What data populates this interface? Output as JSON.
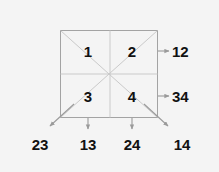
{
  "diagram": {
    "type": "2x2-grid-with-pair-arrows",
    "background_color": "#f4f4f4",
    "grid_line_color": "#c9c9c9",
    "border_color": "#a0a0a0",
    "diagonal_color": "#c9c9c9",
    "arrow_color": "#9a9a9a",
    "text_color": "#111111",
    "square": {
      "x": 60,
      "y": 30,
      "width": 98,
      "height": 88,
      "rows": 2,
      "cols": 2
    },
    "cells": [
      {
        "label": "1",
        "row": 0,
        "col": 0,
        "cx": 88,
        "cy": 51
      },
      {
        "label": "2",
        "row": 0,
        "col": 1,
        "cx": 132,
        "cy": 51
      },
      {
        "label": "3",
        "row": 1,
        "col": 0,
        "cx": 88,
        "cy": 96
      },
      {
        "label": "4",
        "row": 1,
        "col": 1,
        "cx": 132,
        "cy": 96
      }
    ],
    "right_labels": [
      {
        "label": "12",
        "x": 172,
        "y": 44,
        "arrow_from_x": 158,
        "arrow_from_y": 51,
        "arrow_to_x": 169,
        "arrow_to_y": 51
      },
      {
        "label": "34",
        "x": 172,
        "y": 89,
        "arrow_from_x": 158,
        "arrow_from_y": 96,
        "arrow_to_x": 169,
        "arrow_to_y": 96
      }
    ],
    "bottom_labels": [
      {
        "label": "23",
        "x": 40,
        "y": 138,
        "arrow_from_x": 74,
        "arrow_from_y": 104,
        "arrow_to_x": 50,
        "arrow_to_y": 127,
        "direction": "down-left-diagonal"
      },
      {
        "label": "13",
        "x": 88,
        "y": 138,
        "arrow_from_x": 88,
        "arrow_from_y": 118,
        "arrow_to_x": 88,
        "arrow_to_y": 130,
        "direction": "down"
      },
      {
        "label": "24",
        "x": 132,
        "y": 138,
        "arrow_from_x": 132,
        "arrow_from_y": 118,
        "arrow_to_x": 132,
        "arrow_to_y": 130,
        "direction": "down"
      },
      {
        "label": "14",
        "x": 182,
        "y": 138,
        "arrow_from_x": 144,
        "arrow_from_y": 104,
        "arrow_to_x": 168,
        "arrow_to_y": 127,
        "direction": "down-right-diagonal"
      }
    ]
  }
}
